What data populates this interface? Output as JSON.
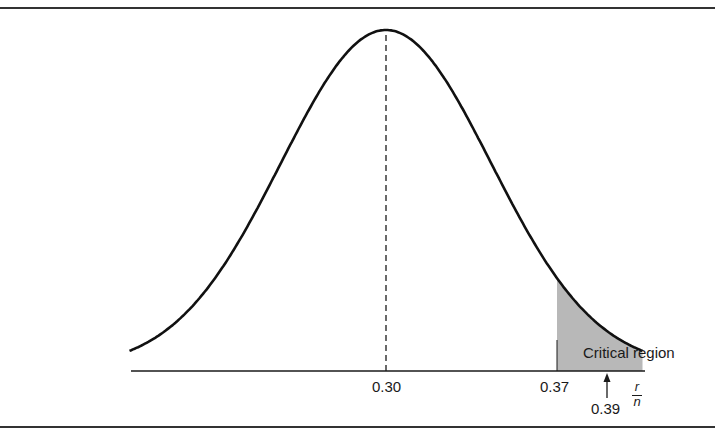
{
  "chart_data": {
    "type": "area",
    "title": "",
    "xlabel": "r/n",
    "ylabel": "",
    "distribution": {
      "family": "normal",
      "mean": 0.3,
      "sd_approx": 0.043
    },
    "x_ticks": [
      {
        "value": 0.3,
        "label": "0.30"
      },
      {
        "value": 0.37,
        "label": "0.37"
      }
    ],
    "reference_lines": [
      {
        "x": 0.3,
        "style": "dashed",
        "from": "axis",
        "to": "peak"
      }
    ],
    "shaded_regions": [
      {
        "from": 0.37,
        "to": 0.405,
        "label": "Critical region",
        "color": "#b8b8b8"
      }
    ],
    "annotations": [
      {
        "text": "Critical region",
        "x": 0.385,
        "position": "above-tail"
      },
      {
        "text": "0.39",
        "x": 0.39,
        "style": "upward-arrow"
      }
    ],
    "xlim": [
      0.195,
      0.405
    ],
    "grid": false,
    "legend": null
  },
  "labels": {
    "tick_mean": "0.30",
    "tick_critical": "0.37",
    "critical_region": "Critical region",
    "observed_value": "0.39",
    "axis_numerator": "r",
    "axis_denominator": "n"
  },
  "colors": {
    "ink": "#1a1a1a",
    "shade": "#b8b8b8",
    "background": "#ffffff"
  }
}
